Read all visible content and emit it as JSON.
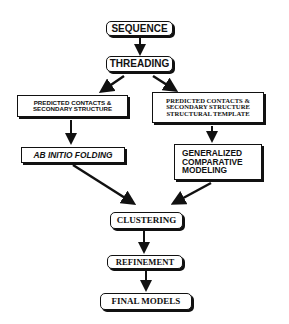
{
  "diagram": {
    "type": "flowchart",
    "nodes": {
      "sequence": {
        "lines": [
          "SEQUENCE"
        ]
      },
      "threading": {
        "lines": [
          "THREADING"
        ]
      },
      "left_predicted": {
        "lines": [
          "PREDICTED CONTACTS &",
          "SECONDARY STRUCTURE"
        ]
      },
      "right_predicted": {
        "lines": [
          "PREDICTED CONTACTS &",
          "SECONDARY STRUCTURE",
          "STRUCTURAL TEMPLATE"
        ]
      },
      "ab_initio": {
        "lines": [
          "AB INITIO FOLDING"
        ]
      },
      "comparative": {
        "lines": [
          "GENERALIZED",
          "COMPARATIVE",
          "MODELING"
        ]
      },
      "clustering": {
        "lines": [
          "CLUSTERING"
        ]
      },
      "refinement": {
        "lines": [
          "REFINEMENT"
        ]
      },
      "final_models": {
        "lines": [
          "FINAL MODELS"
        ]
      }
    },
    "edges": [
      {
        "from": "sequence",
        "to": "threading"
      },
      {
        "from": "threading",
        "to": "left_predicted"
      },
      {
        "from": "threading",
        "to": "right_predicted"
      },
      {
        "from": "left_predicted",
        "to": "ab_initio"
      },
      {
        "from": "right_predicted",
        "to": "comparative"
      },
      {
        "from": "ab_initio",
        "to": "clustering"
      },
      {
        "from": "comparative",
        "to": "clustering"
      },
      {
        "from": "clustering",
        "to": "refinement"
      },
      {
        "from": "refinement",
        "to": "final_models"
      }
    ],
    "colors": {
      "stroke": "#111111",
      "background": "#ffffff"
    }
  }
}
